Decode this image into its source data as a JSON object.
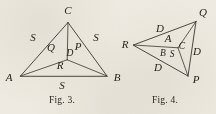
{
  "page": {
    "background_color": "#eeeae1",
    "ink_color": "#3a3630",
    "width": 216,
    "height": 114
  },
  "figures": [
    {
      "id": "fig-3",
      "caption": "Fig. 3.",
      "caption_x": 62,
      "caption_y": 101,
      "description": "Triangle ABC with interior point D joined to all three vertices",
      "vertices": [
        {
          "name": "C",
          "label": "C",
          "x": 68,
          "y": 22,
          "label_x": 68,
          "label_y": 11
        },
        {
          "name": "A",
          "label": "A",
          "x": 20,
          "y": 76,
          "label_x": 9,
          "label_y": 78
        },
        {
          "name": "B",
          "label": "B",
          "x": 107,
          "y": 76,
          "label_x": 117,
          "label_y": 78
        },
        {
          "name": "D",
          "label": "D",
          "x": 67,
          "y": 60,
          "label_x": 70,
          "label_y": 54
        }
      ],
      "edges": [
        {
          "name": "side-AC",
          "from": "A",
          "to": "C"
        },
        {
          "name": "side-CB",
          "from": "C",
          "to": "B"
        },
        {
          "name": "side-AB",
          "from": "A",
          "to": "B"
        },
        {
          "name": "cevian-CD",
          "from": "C",
          "to": "D"
        },
        {
          "name": "cevian-AD",
          "from": "A",
          "to": "D"
        },
        {
          "name": "cevian-BD",
          "from": "B",
          "to": "D"
        }
      ],
      "region_labels": [
        {
          "name": "region-Q",
          "text": "Q",
          "x": 51,
          "y": 48
        },
        {
          "name": "region-P",
          "text": "P",
          "x": 78,
          "y": 47
        },
        {
          "name": "region-R",
          "text": "R",
          "x": 60,
          "y": 66
        }
      ],
      "side_labels": [
        {
          "name": "side-label-S-left",
          "text": "S",
          "x": 33,
          "y": 38
        },
        {
          "name": "side-label-S-right",
          "text": "S",
          "x": 96,
          "y": 38
        },
        {
          "name": "side-label-S-bottom",
          "text": "S",
          "x": 62,
          "y": 86
        }
      ]
    },
    {
      "id": "fig-4",
      "caption": "Fig. 4.",
      "caption_x": 165,
      "caption_y": 101,
      "description": "Triangle PQR with interior point C joined to all three vertices",
      "vertices": [
        {
          "name": "Q",
          "label": "Q",
          "x": 196,
          "y": 21,
          "label_x": 203,
          "label_y": 13
        },
        {
          "name": "R",
          "label": "R",
          "x": 133,
          "y": 45,
          "label_x": 125,
          "label_y": 45
        },
        {
          "name": "P",
          "label": "P",
          "x": 188,
          "y": 76,
          "label_x": 196,
          "label_y": 80
        },
        {
          "name": "C",
          "label": "C",
          "x": 178,
          "y": 48,
          "label_x": 181,
          "label_y": 47
        }
      ],
      "edges": [
        {
          "name": "side-RQ",
          "from": "R",
          "to": "Q"
        },
        {
          "name": "side-QP",
          "from": "Q",
          "to": "P"
        },
        {
          "name": "side-RP",
          "from": "R",
          "to": "P"
        },
        {
          "name": "cevian-RC",
          "from": "R",
          "to": "C"
        },
        {
          "name": "cevian-QC",
          "from": "Q",
          "to": "C"
        },
        {
          "name": "cevian-PC",
          "from": "P",
          "to": "C"
        }
      ],
      "region_labels": [
        {
          "name": "region-A",
          "text": "A",
          "x": 168,
          "y": 39
        },
        {
          "name": "region-B",
          "text": "B",
          "x": 163,
          "y": 54
        },
        {
          "name": "region-S",
          "text": "S",
          "x": 172,
          "y": 55
        }
      ],
      "side_labels": [
        {
          "name": "side-label-D-top",
          "text": "D",
          "x": 160,
          "y": 29
        },
        {
          "name": "side-label-D-right",
          "text": "D",
          "x": 196,
          "y": 52
        },
        {
          "name": "side-label-D-bottom",
          "text": "D",
          "x": 158,
          "y": 68
        }
      ]
    }
  ]
}
